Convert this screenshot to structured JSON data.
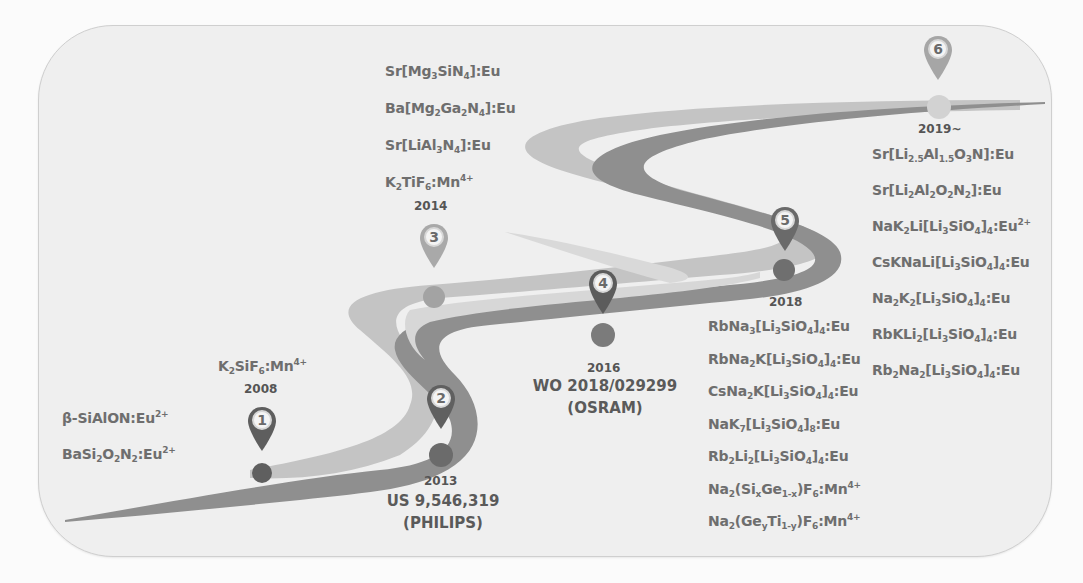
{
  "colors": {
    "background": "#fbfbfb",
    "card": "#ededed",
    "card_border": "#cfcfcf",
    "road_dark": "#8a8a8a",
    "road_light": "#bdbdbd",
    "text": "#6e6e6e",
    "pin_dark": "#5e5e5e",
    "pin_light": "#a9a9a9"
  },
  "milestones": [
    {
      "number": "1",
      "year": "2008",
      "pin_style": "dark",
      "phosphors_above": [
        [
          {
            "t": "K"
          },
          {
            "sub": "2"
          },
          {
            "t": "SiF"
          },
          {
            "sub": "6"
          },
          {
            "t": ":Mn"
          },
          {
            "sup": "4+"
          }
        ]
      ],
      "phosphors_left": [
        [
          {
            "t": "β-SiAlON:Eu"
          },
          {
            "sup": "2+"
          }
        ],
        [
          {
            "t": "BaSi"
          },
          {
            "sub": "2"
          },
          {
            "t": "O"
          },
          {
            "sub": "2"
          },
          {
            "t": "N"
          },
          {
            "sub": "2"
          },
          {
            "t": ":Eu"
          },
          {
            "sup": "2+"
          }
        ]
      ]
    },
    {
      "number": "2",
      "year": "2013",
      "pin_style": "dark",
      "patent": "US 9,546,319",
      "assignee": "(PHILIPS)"
    },
    {
      "number": "3",
      "year": "2014",
      "pin_style": "light",
      "phosphors": [
        [
          {
            "t": "Sr[Mg"
          },
          {
            "sub": "3"
          },
          {
            "t": "SiN"
          },
          {
            "sub": "4"
          },
          {
            "t": "]:Eu"
          }
        ],
        [
          {
            "t": "Ba[Mg"
          },
          {
            "sub": "2"
          },
          {
            "t": "Ga"
          },
          {
            "sub": "2"
          },
          {
            "t": "N"
          },
          {
            "sub": "4"
          },
          {
            "t": "]:Eu"
          }
        ],
        [
          {
            "t": "Sr[LiAl"
          },
          {
            "sub": "3"
          },
          {
            "t": "N"
          },
          {
            "sub": "4"
          },
          {
            "t": "]:Eu"
          }
        ],
        [
          {
            "t": "K"
          },
          {
            "sub": "2"
          },
          {
            "t": "TiF"
          },
          {
            "sub": "6"
          },
          {
            "t": ":Mn"
          },
          {
            "sup": "4+"
          }
        ]
      ]
    },
    {
      "number": "4",
      "year": "2016",
      "pin_style": "dark",
      "patent": "WO 2018/029299",
      "assignee": "(OSRAM)"
    },
    {
      "number": "5",
      "year": "2018",
      "pin_style": "dark",
      "phosphors": [
        [
          {
            "t": "RbNa"
          },
          {
            "sub": "3"
          },
          {
            "t": "[Li"
          },
          {
            "sub": "3"
          },
          {
            "t": "SiO"
          },
          {
            "sub": "4"
          },
          {
            "t": "]"
          },
          {
            "sub": "4"
          },
          {
            "t": ":Eu"
          }
        ],
        [
          {
            "t": "RbNa"
          },
          {
            "sub": "2"
          },
          {
            "t": "K[Li"
          },
          {
            "sub": "3"
          },
          {
            "t": "SiO"
          },
          {
            "sub": "4"
          },
          {
            "t": "]"
          },
          {
            "sub": "4"
          },
          {
            "t": ":Eu"
          }
        ],
        [
          {
            "t": "CsNa"
          },
          {
            "sub": "2"
          },
          {
            "t": "K[Li"
          },
          {
            "sub": "3"
          },
          {
            "t": "SiO"
          },
          {
            "sub": "4"
          },
          {
            "t": "]"
          },
          {
            "sub": "4"
          },
          {
            "t": ":Eu"
          }
        ],
        [
          {
            "t": "NaK"
          },
          {
            "sub": "7"
          },
          {
            "t": "[Li"
          },
          {
            "sub": "3"
          },
          {
            "t": "SiO"
          },
          {
            "sub": "4"
          },
          {
            "t": "]"
          },
          {
            "sub": "8"
          },
          {
            "t": ":Eu"
          }
        ],
        [
          {
            "t": "Rb"
          },
          {
            "sub": "2"
          },
          {
            "t": "Li"
          },
          {
            "sub": "2"
          },
          {
            "t": "[Li"
          },
          {
            "sub": "3"
          },
          {
            "t": "SiO"
          },
          {
            "sub": "4"
          },
          {
            "t": "]"
          },
          {
            "sub": "4"
          },
          {
            "t": ":Eu"
          }
        ],
        [
          {
            "t": "Na"
          },
          {
            "sub": "2"
          },
          {
            "t": "(Si"
          },
          {
            "sub": "x"
          },
          {
            "t": "Ge"
          },
          {
            "sub": "1-x"
          },
          {
            "t": ")F"
          },
          {
            "sub": "6"
          },
          {
            "t": ":Mn"
          },
          {
            "sup": "4+"
          }
        ],
        [
          {
            "t": "Na"
          },
          {
            "sub": "2"
          },
          {
            "t": "(Ge"
          },
          {
            "sub": "y"
          },
          {
            "t": "Ti"
          },
          {
            "sub": "1-y"
          },
          {
            "t": ")F"
          },
          {
            "sub": "6"
          },
          {
            "t": ":Mn"
          },
          {
            "sup": "4+"
          }
        ]
      ]
    },
    {
      "number": "6",
      "year": "2019~",
      "pin_style": "light",
      "phosphors": [
        [
          {
            "t": "Sr[Li"
          },
          {
            "sub": "2.5"
          },
          {
            "t": "Al"
          },
          {
            "sub": "1.5"
          },
          {
            "t": "O"
          },
          {
            "sub": "3"
          },
          {
            "t": "N]:Eu"
          }
        ],
        [
          {
            "t": "Sr[Li"
          },
          {
            "sub": "2"
          },
          {
            "t": "Al"
          },
          {
            "sub": "2"
          },
          {
            "t": "O"
          },
          {
            "sub": "2"
          },
          {
            "t": "N"
          },
          {
            "sub": "2"
          },
          {
            "t": "]:Eu"
          }
        ],
        [
          {
            "t": "NaK"
          },
          {
            "sub": "2"
          },
          {
            "t": "Li[Li"
          },
          {
            "sub": "3"
          },
          {
            "t": "SiO"
          },
          {
            "sub": "4"
          },
          {
            "t": "]"
          },
          {
            "sub": "4"
          },
          {
            "t": ":Eu"
          },
          {
            "sup": "2+"
          }
        ],
        [
          {
            "t": "CsKNaLi[Li"
          },
          {
            "sub": "3"
          },
          {
            "t": "SiO"
          },
          {
            "sub": "4"
          },
          {
            "t": "]"
          },
          {
            "sub": "4"
          },
          {
            "t": ":Eu"
          }
        ],
        [
          {
            "t": "Na"
          },
          {
            "sub": "2"
          },
          {
            "t": "K"
          },
          {
            "sub": "2"
          },
          {
            "t": "[Li"
          },
          {
            "sub": "3"
          },
          {
            "t": "SiO"
          },
          {
            "sub": "4"
          },
          {
            "t": "]"
          },
          {
            "sub": "4"
          },
          {
            "t": ":Eu"
          }
        ],
        [
          {
            "t": "RbKLi"
          },
          {
            "sub": "2"
          },
          {
            "t": "[Li"
          },
          {
            "sub": "3"
          },
          {
            "t": "SiO"
          },
          {
            "sub": "4"
          },
          {
            "t": "]"
          },
          {
            "sub": "4"
          },
          {
            "t": ":Eu"
          }
        ],
        [
          {
            "t": "Rb"
          },
          {
            "sub": "2"
          },
          {
            "t": "Na"
          },
          {
            "sub": "2"
          },
          {
            "t": "[Li"
          },
          {
            "sub": "3"
          },
          {
            "t": "SiO"
          },
          {
            "sub": "4"
          },
          {
            "t": "]"
          },
          {
            "sub": "4"
          },
          {
            "t": ":Eu"
          }
        ]
      ]
    }
  ]
}
